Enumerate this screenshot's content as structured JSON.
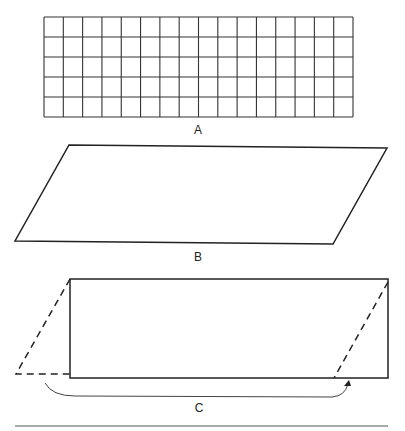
{
  "figures": {
    "a": {
      "label": "A",
      "description": "Rectangular grid of unit squares",
      "columns": 16,
      "rows": 5
    },
    "b": {
      "label": "B",
      "description": "Parallelogram with same base and height as grid A"
    },
    "c": {
      "label": "C",
      "description": "Rectangle formed by moving the triangle cut from one end of the parallelogram to the other",
      "arrow": "curved-arrow-left-to-right"
    }
  },
  "colors": {
    "line": "#222222",
    "background": "#ffffff"
  }
}
